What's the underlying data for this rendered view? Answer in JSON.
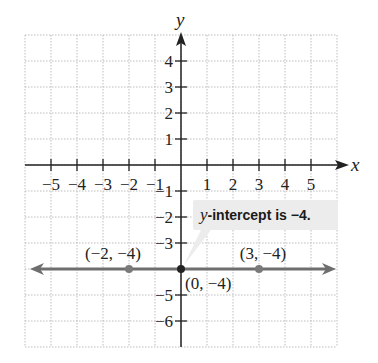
{
  "chart_data": {
    "type": "line",
    "title": "",
    "xlabel": "x",
    "ylabel": "y",
    "xlim": [
      -6,
      6
    ],
    "ylim": [
      -7,
      5
    ],
    "grid": true,
    "x_ticks": [
      -5,
      -4,
      -3,
      -2,
      -1,
      1,
      2,
      3,
      4,
      5
    ],
    "y_ticks": [
      -6,
      -5,
      -3,
      -2,
      -1,
      1,
      2,
      3,
      4
    ],
    "x_tick_labels": [
      "−5",
      "−4",
      "−3",
      "−2",
      "−1",
      "1",
      "2",
      "3",
      "4",
      "5"
    ],
    "y_tick_labels": [
      "−6",
      "−5",
      "−3",
      "−2",
      "−1",
      "1",
      "2",
      "3",
      "4"
    ],
    "series": [
      {
        "name": "y = −4",
        "equation": "y = -4",
        "x": [
          -6,
          6
        ],
        "y": [
          -4,
          -4
        ],
        "color": "#6e6e6e",
        "arrows": "both"
      }
    ],
    "points": [
      {
        "x": -2,
        "y": -4,
        "label": "(−2, −4)"
      },
      {
        "x": 0,
        "y": -4,
        "label": "(0, −4)"
      },
      {
        "x": 3,
        "y": -4,
        "label": "(3, −4)"
      }
    ],
    "annotations": [
      {
        "text_italic": "y",
        "text": "-intercept is −4.",
        "target": {
          "x": 0,
          "y": -4
        }
      }
    ]
  },
  "colors": {
    "axis": "#222222",
    "grid": "#bdbdbd",
    "line": "#6e6e6e",
    "point": "#7a7a7a",
    "origin_point": "#222222",
    "callout_bg": "#ececec"
  }
}
